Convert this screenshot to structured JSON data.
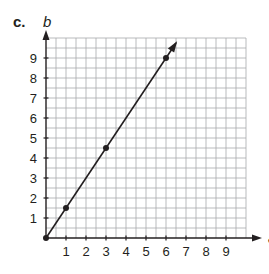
{
  "part_label": "c.",
  "chart_data": {
    "type": "line",
    "title": "",
    "xlabel": "a",
    "ylabel": "b",
    "xlim": [
      0,
      10
    ],
    "ylim": [
      0,
      10
    ],
    "x_ticks": [
      1,
      2,
      3,
      4,
      5,
      6,
      7,
      8,
      9
    ],
    "y_ticks": [
      1,
      2,
      3,
      4,
      5,
      6,
      7,
      8,
      9
    ],
    "grid": true,
    "grid_minor_step": 0.5,
    "series": [
      {
        "name": "b = 1.5a",
        "points": [
          [
            0,
            0
          ],
          [
            1,
            1.5
          ],
          [
            3,
            4.5
          ],
          [
            6,
            9
          ]
        ],
        "line_end": [
          6.5,
          9.75
        ],
        "arrow_at_end": true
      }
    ]
  },
  "colors": {
    "grid": "#a7a9ac",
    "axis": "#231f20",
    "line": "#231f20",
    "text": "#231f20"
  }
}
